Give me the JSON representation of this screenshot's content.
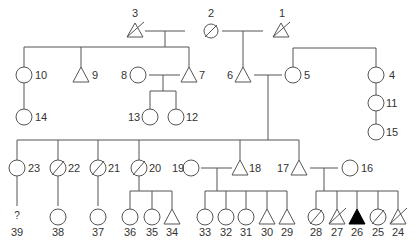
{
  "diagram": {
    "type": "pedigree-chart",
    "colors": {
      "line": "#555555",
      "affected_fill": "#000000",
      "background": "#ffffff",
      "label": "#333333"
    },
    "individuals": [
      {
        "id": "1",
        "label": "1",
        "sex": "male",
        "deceased": true,
        "affected": false,
        "generation": 1
      },
      {
        "id": "2",
        "label": "2",
        "sex": "female",
        "deceased": true,
        "affected": false,
        "generation": 1
      },
      {
        "id": "3",
        "label": "3",
        "sex": "male",
        "deceased": true,
        "affected": false,
        "generation": 1
      },
      {
        "id": "4",
        "label": "4",
        "sex": "female",
        "deceased": false,
        "affected": false,
        "generation": 2
      },
      {
        "id": "5",
        "label": "5",
        "sex": "female",
        "deceased": false,
        "affected": false,
        "generation": 2
      },
      {
        "id": "6",
        "label": "6",
        "sex": "male",
        "deceased": false,
        "affected": false,
        "generation": 2
      },
      {
        "id": "7",
        "label": "7",
        "sex": "male",
        "deceased": false,
        "affected": false,
        "generation": 2
      },
      {
        "id": "8",
        "label": "8",
        "sex": "female",
        "deceased": false,
        "affected": false,
        "generation": 2
      },
      {
        "id": "9",
        "label": "9",
        "sex": "male",
        "deceased": false,
        "affected": false,
        "generation": 2
      },
      {
        "id": "10",
        "label": "10",
        "sex": "female",
        "deceased": false,
        "affected": false,
        "generation": 2
      },
      {
        "id": "11",
        "label": "11",
        "sex": "female",
        "deceased": false,
        "affected": false,
        "generation": 3
      },
      {
        "id": "12",
        "label": "12",
        "sex": "female",
        "deceased": false,
        "affected": false,
        "generation": 3
      },
      {
        "id": "13",
        "label": "13",
        "sex": "female",
        "deceased": false,
        "affected": false,
        "generation": 3
      },
      {
        "id": "14",
        "label": "14",
        "sex": "female",
        "deceased": false,
        "affected": false,
        "generation": 3
      },
      {
        "id": "15",
        "label": "15",
        "sex": "female",
        "deceased": false,
        "affected": false,
        "generation": 4
      },
      {
        "id": "16",
        "label": "16",
        "sex": "female",
        "deceased": false,
        "affected": false,
        "generation": 3
      },
      {
        "id": "17",
        "label": "17",
        "sex": "male",
        "deceased": false,
        "affected": false,
        "generation": 3
      },
      {
        "id": "18",
        "label": "18",
        "sex": "male",
        "deceased": false,
        "affected": false,
        "generation": 3
      },
      {
        "id": "19",
        "label": "19",
        "sex": "female",
        "deceased": false,
        "affected": false,
        "generation": 3
      },
      {
        "id": "20",
        "label": "20",
        "sex": "female",
        "deceased": true,
        "affected": false,
        "generation": 3
      },
      {
        "id": "21",
        "label": "21",
        "sex": "female",
        "deceased": true,
        "affected": false,
        "generation": 3
      },
      {
        "id": "22",
        "label": "22",
        "sex": "female",
        "deceased": true,
        "affected": false,
        "generation": 3
      },
      {
        "id": "23",
        "label": "23",
        "sex": "female",
        "deceased": false,
        "affected": false,
        "generation": 3
      },
      {
        "id": "24",
        "label": "24",
        "sex": "male",
        "deceased": true,
        "affected": false,
        "generation": 4
      },
      {
        "id": "25",
        "label": "25",
        "sex": "female",
        "deceased": true,
        "affected": false,
        "generation": 4
      },
      {
        "id": "26",
        "label": "26",
        "sex": "male",
        "deceased": false,
        "affected": true,
        "generation": 4
      },
      {
        "id": "27",
        "label": "27",
        "sex": "male",
        "deceased": true,
        "affected": false,
        "generation": 4
      },
      {
        "id": "28",
        "label": "28",
        "sex": "female",
        "deceased": true,
        "affected": false,
        "generation": 4
      },
      {
        "id": "29",
        "label": "29",
        "sex": "male",
        "deceased": false,
        "affected": false,
        "generation": 4
      },
      {
        "id": "30",
        "label": "30",
        "sex": "male",
        "deceased": false,
        "affected": false,
        "generation": 4
      },
      {
        "id": "31",
        "label": "31",
        "sex": "female",
        "deceased": false,
        "affected": false,
        "generation": 4
      },
      {
        "id": "32",
        "label": "32",
        "sex": "female",
        "deceased": false,
        "affected": false,
        "generation": 4
      },
      {
        "id": "33",
        "label": "33",
        "sex": "female",
        "deceased": false,
        "affected": false,
        "generation": 4
      },
      {
        "id": "34",
        "label": "34",
        "sex": "male",
        "deceased": false,
        "affected": false,
        "generation": 4
      },
      {
        "id": "35",
        "label": "35",
        "sex": "female",
        "deceased": false,
        "affected": false,
        "generation": 4
      },
      {
        "id": "36",
        "label": "36",
        "sex": "female",
        "deceased": false,
        "affected": false,
        "generation": 4
      },
      {
        "id": "37",
        "label": "37",
        "sex": "female",
        "deceased": false,
        "affected": false,
        "generation": 4
      },
      {
        "id": "38",
        "label": "38",
        "sex": "female",
        "deceased": false,
        "affected": false,
        "generation": 4
      },
      {
        "id": "39",
        "label": "39",
        "sex": "unknown",
        "deceased": false,
        "affected": false,
        "generation": 4,
        "symbol_text": "?"
      }
    ],
    "unions": [
      {
        "partners": [
          "3",
          "2"
        ],
        "children": [
          "10",
          "9",
          "7"
        ]
      },
      {
        "partners": [
          "2",
          "1"
        ],
        "children": [
          "6"
        ]
      },
      {
        "partners": [
          "8",
          "7"
        ],
        "children": [
          "13",
          "12"
        ]
      },
      {
        "partners": [
          "6",
          "5"
        ],
        "children": [
          "23",
          "22",
          "21",
          "20",
          "18",
          "17"
        ]
      },
      {
        "partners": [
          "19",
          "18"
        ],
        "children": [
          "33",
          "32",
          "31",
          "30",
          "29"
        ]
      },
      {
        "partners": [
          "17",
          "16"
        ],
        "children": [
          "28",
          "27",
          "26",
          "25",
          "24"
        ]
      }
    ],
    "siblings": [
      [
        "5",
        "4"
      ]
    ],
    "single_parent_lines": [
      {
        "parent": "10",
        "child": "14"
      },
      {
        "parent": "4",
        "child": "11"
      },
      {
        "parent": "11",
        "child": "15"
      },
      {
        "parent": "23",
        "child": "39"
      },
      {
        "parent": "22",
        "child": "38"
      },
      {
        "parent": "21",
        "child": "37"
      },
      {
        "parent": "20",
        "children": [
          "36",
          "35",
          "34"
        ]
      }
    ],
    "labels": {
      "n1": "1",
      "n2": "2",
      "n3": "3",
      "n4": "4",
      "n5": "5",
      "n6": "6",
      "n7": "7",
      "n8": "8",
      "n9": "9",
      "n10": "10",
      "n11": "11",
      "n12": "12",
      "n13": "13",
      "n14": "14",
      "n15": "15",
      "n16": "16",
      "n17": "17",
      "n18": "18",
      "n19": "19",
      "n20": "20",
      "n21": "21",
      "n22": "22",
      "n23": "23",
      "n24": "24",
      "n25": "25",
      "n26": "26",
      "n27": "27",
      "n28": "28",
      "n29": "29",
      "n30": "30",
      "n31": "31",
      "n32": "32",
      "n33": "33",
      "n34": "34",
      "n35": "35",
      "n36": "36",
      "n37": "37",
      "n38": "38",
      "n39": "39",
      "unknown_mark": "?"
    }
  }
}
